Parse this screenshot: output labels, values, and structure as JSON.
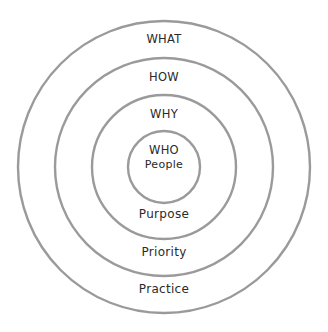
{
  "diagram": {
    "type": "concentric-circles",
    "center": [
      164,
      167
    ],
    "ring_color": "#9a9a9a",
    "rings": [
      {
        "radius": 146,
        "upper_label": "WHAT",
        "lower_label": "Practice"
      },
      {
        "radius": 109,
        "upper_label": "HOW",
        "lower_label": "Priority"
      },
      {
        "radius": 72,
        "upper_label": "WHY",
        "lower_label": "Purpose"
      },
      {
        "radius": 36,
        "upper_label": "WHO",
        "lower_label": "People"
      }
    ]
  }
}
